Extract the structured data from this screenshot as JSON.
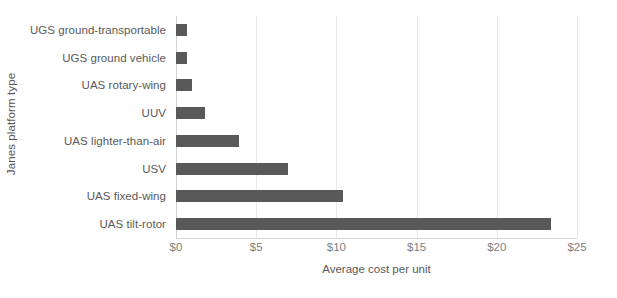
{
  "chart_data": {
    "type": "bar",
    "orientation": "horizontal",
    "title": "",
    "xlabel": "Average cost per unit",
    "ylabel": "Janes platform type",
    "categories": [
      "UGS ground-transportable",
      "UGS ground vehicle",
      "UAS rotary-wing",
      "UUV",
      "UAS lighter-than-air",
      "USV",
      "UAS fixed-wing",
      "UAS tilt-rotor"
    ],
    "values": [
      0.7,
      0.7,
      1.0,
      1.8,
      3.9,
      7.0,
      10.4,
      23.4
    ],
    "xlim": [
      0,
      25
    ],
    "xticks": [
      0,
      5,
      10,
      15,
      20,
      25
    ],
    "xticklabels": [
      "$0",
      "$5",
      "$10",
      "$15",
      "$20",
      "$25"
    ],
    "grid": true,
    "grid_axis": "x",
    "legend": false,
    "bar_color": "#595959",
    "gridline_color": "#e8e8e8",
    "axis_text_color": "#595959",
    "tick_text_color": "#808080"
  }
}
